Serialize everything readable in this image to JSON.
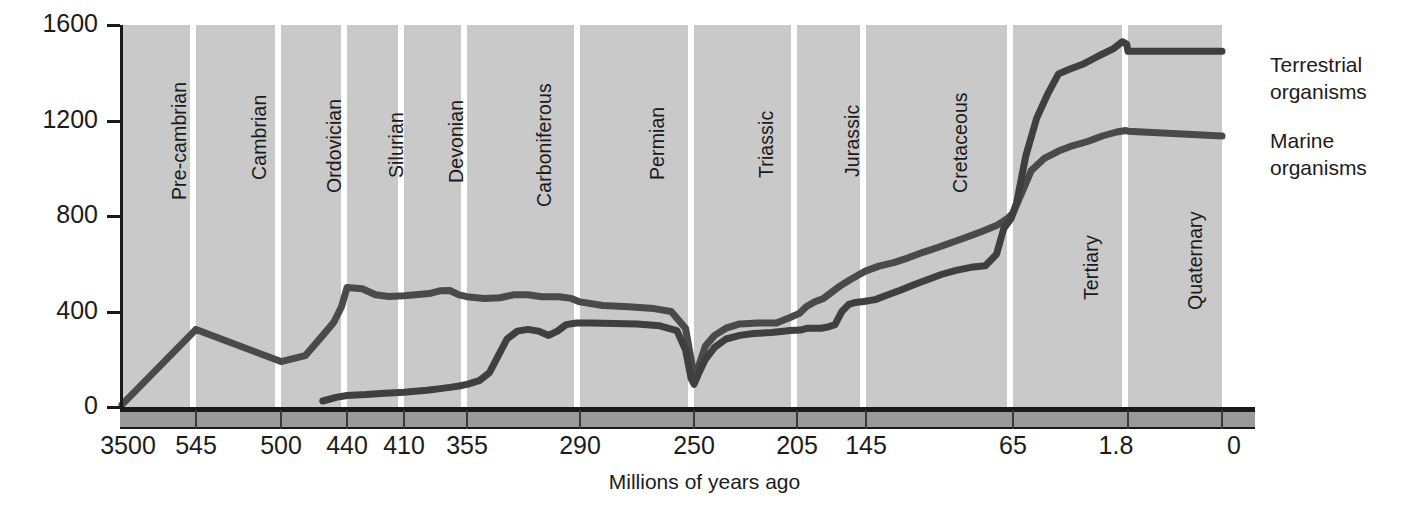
{
  "chart_data": {
    "type": "line",
    "title": "",
    "xlabel": "Millions of years ago",
    "ylabel": "Number of families",
    "xlim": [
      3500,
      0
    ],
    "ylim": [
      0,
      1600
    ],
    "grid": false,
    "legend_position": "right",
    "x_tick_labels": [
      "3500",
      "545",
      "500",
      "440",
      "410",
      "355",
      "290",
      "250",
      "205",
      "145",
      "65",
      "1.8",
      "0"
    ],
    "y_tick_labels": [
      "0",
      "400",
      "800",
      "1200",
      "1600"
    ],
    "y_ticks": [
      0,
      400,
      800,
      1200,
      1600
    ],
    "period_bands": [
      {
        "name": "Pre-cambrian",
        "start": 3500,
        "end": 545
      },
      {
        "name": "Cambrian",
        "start": 545,
        "end": 500
      },
      {
        "name": "Ordovician",
        "start": 500,
        "end": 440
      },
      {
        "name": "Silurian",
        "start": 440,
        "end": 410
      },
      {
        "name": "Devonian",
        "start": 410,
        "end": 355
      },
      {
        "name": "Carboniferous",
        "start": 355,
        "end": 290
      },
      {
        "name": "Permian",
        "start": 290,
        "end": 250
      },
      {
        "name": "Triassic",
        "start": 250,
        "end": 205
      },
      {
        "name": "Jurassic",
        "start": 205,
        "end": 145
      },
      {
        "name": "Cretaceous",
        "start": 145,
        "end": 65
      },
      {
        "name": "Tertiary",
        "start": 65,
        "end": 1.8
      },
      {
        "name": "Quaternary",
        "start": 1.8,
        "end": 0
      }
    ],
    "series": [
      {
        "name": "Marine organisms",
        "color": "#4a4a4a",
        "points": [
          [
            3500,
            10
          ],
          [
            545,
            325
          ],
          [
            500,
            190
          ],
          [
            478,
            215
          ],
          [
            462,
            300
          ],
          [
            452,
            355
          ],
          [
            445,
            420
          ],
          [
            440,
            500
          ],
          [
            432,
            495
          ],
          [
            425,
            470
          ],
          [
            418,
            463
          ],
          [
            410,
            466
          ],
          [
            400,
            470
          ],
          [
            388,
            475
          ],
          [
            378,
            487
          ],
          [
            370,
            488
          ],
          [
            362,
            470
          ],
          [
            355,
            462
          ],
          [
            345,
            455
          ],
          [
            336,
            458
          ],
          [
            328,
            470
          ],
          [
            320,
            470
          ],
          [
            312,
            462
          ],
          [
            302,
            462
          ],
          [
            295,
            455
          ],
          [
            290,
            440
          ],
          [
            282,
            425
          ],
          [
            273,
            420
          ],
          [
            264,
            412
          ],
          [
            258,
            400
          ],
          [
            253,
            330
          ],
          [
            251,
            200
          ],
          [
            250,
            130
          ],
          [
            248,
            170
          ],
          [
            245,
            255
          ],
          [
            241,
            300
          ],
          [
            236,
            330
          ],
          [
            230,
            348
          ],
          [
            222,
            352
          ],
          [
            214,
            352
          ],
          [
            208,
            375
          ],
          [
            203,
            392
          ],
          [
            197,
            420
          ],
          [
            190,
            440
          ],
          [
            182,
            455
          ],
          [
            175,
            480
          ],
          [
            168,
            505
          ],
          [
            160,
            530
          ],
          [
            152,
            552
          ],
          [
            145,
            570
          ],
          [
            138,
            590
          ],
          [
            130,
            605
          ],
          [
            122,
            625
          ],
          [
            114,
            648
          ],
          [
            106,
            668
          ],
          [
            98,
            690
          ],
          [
            90,
            712
          ],
          [
            82,
            735
          ],
          [
            74,
            760
          ],
          [
            68,
            790
          ],
          [
            65,
            812
          ],
          [
            60,
            900
          ],
          [
            55,
            990
          ],
          [
            48,
            1040
          ],
          [
            40,
            1072
          ],
          [
            32,
            1095
          ],
          [
            24,
            1112
          ],
          [
            16,
            1135
          ],
          [
            8,
            1152
          ],
          [
            3,
            1158
          ],
          [
            1.8,
            1155
          ],
          [
            0,
            1135
          ]
        ]
      },
      {
        "name": "Terrestrial organisms",
        "color": "#3f3f3f",
        "points": [
          [
            462,
            25
          ],
          [
            450,
            40
          ],
          [
            440,
            48
          ],
          [
            430,
            52
          ],
          [
            420,
            58
          ],
          [
            410,
            62
          ],
          [
            400,
            66
          ],
          [
            390,
            70
          ],
          [
            380,
            76
          ],
          [
            370,
            82
          ],
          [
            362,
            88
          ],
          [
            355,
            95
          ],
          [
            348,
            110
          ],
          [
            342,
            145
          ],
          [
            337,
            215
          ],
          [
            332,
            285
          ],
          [
            326,
            318
          ],
          [
            320,
            325
          ],
          [
            314,
            318
          ],
          [
            308,
            300
          ],
          [
            303,
            318
          ],
          [
            298,
            345
          ],
          [
            292,
            352
          ],
          [
            286,
            352
          ],
          [
            278,
            350
          ],
          [
            270,
            348
          ],
          [
            262,
            340
          ],
          [
            256,
            320
          ],
          [
            253,
            240
          ],
          [
            251,
            120
          ],
          [
            250,
            95
          ],
          [
            248,
            140
          ],
          [
            245,
            200
          ],
          [
            241,
            250
          ],
          [
            236,
            285
          ],
          [
            230,
            300
          ],
          [
            224,
            308
          ],
          [
            216,
            312
          ],
          [
            208,
            320
          ],
          [
            202,
            322
          ],
          [
            196,
            330
          ],
          [
            190,
            330
          ],
          [
            184,
            330
          ],
          [
            178,
            335
          ],
          [
            172,
            345
          ],
          [
            166,
            400
          ],
          [
            160,
            430
          ],
          [
            154,
            438
          ],
          [
            147,
            442
          ],
          [
            140,
            450
          ],
          [
            133,
            470
          ],
          [
            126,
            490
          ],
          [
            119,
            512
          ],
          [
            112,
            532
          ],
          [
            104,
            555
          ],
          [
            96,
            572
          ],
          [
            88,
            585
          ],
          [
            80,
            592
          ],
          [
            74,
            640
          ],
          [
            70,
            748
          ],
          [
            66,
            790
          ],
          [
            63,
            855
          ],
          [
            58,
            1050
          ],
          [
            52,
            1210
          ],
          [
            46,
            1310
          ],
          [
            40,
            1395
          ],
          [
            34,
            1415
          ],
          [
            26,
            1438
          ],
          [
            18,
            1470
          ],
          [
            10,
            1500
          ],
          [
            5,
            1530
          ],
          [
            2.5,
            1520
          ],
          [
            1.8,
            1490
          ],
          [
            0,
            1490
          ]
        ]
      }
    ]
  },
  "legend": {
    "entries": [
      {
        "line1": "Terrestrial",
        "line2": "organisms"
      },
      {
        "line1": "Marine",
        "line2": "organisms"
      }
    ]
  },
  "colors": {
    "plot_background": "#c9c9c9",
    "band_separator": "#ffffff",
    "axis": "#1a1a1a",
    "footer_band": "#9a9a9a",
    "text": "#1c1c1c"
  }
}
